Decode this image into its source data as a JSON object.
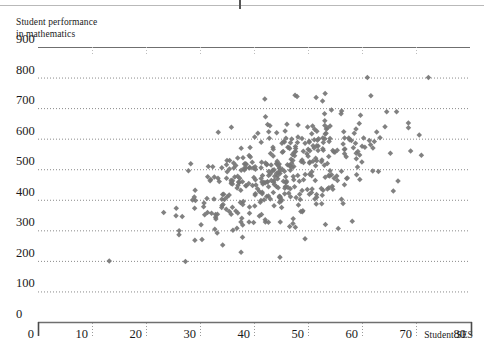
{
  "figure": {
    "y_axis_caption_line1": "Student performance",
    "y_axis_caption_line2": "in mathematics",
    "x_axis_caption": "Student SES"
  },
  "chart_data": {
    "type": "scatter",
    "title": "",
    "xlabel": "Student SES",
    "ylabel": "Student performance in mathematics",
    "xlim": [
      0,
      80
    ],
    "ylim": [
      0,
      900
    ],
    "xticks": [
      0,
      10,
      20,
      30,
      40,
      50,
      60,
      70,
      80
    ],
    "yticks": [
      0,
      100,
      200,
      300,
      400,
      500,
      600,
      700,
      800,
      900
    ],
    "grid": "horizontal dotted gridlines at every 100 on y; solid rules at y=900 and y=0; short dotted vertical ticks below baseline at each x tick",
    "legend": "none",
    "marker": "diamond",
    "marker_color": "#767676",
    "marker_size_px": 5.5,
    "n_points": 420,
    "correlation_note": "Positive association between student SES and mathematics performance; cloud centred near SES 45, score 480.",
    "cloud": {
      "x_mean": 45.0,
      "x_sd": 8.6,
      "x_min": 23.0,
      "x_max": 69.0,
      "y_intercept": 205,
      "y_slope": 6.2,
      "y_residual_sd": 82,
      "y_min": 240,
      "y_max": 760,
      "seed": 20240517
    },
    "outliers": [
      {
        "x": 13.2,
        "y": 200
      },
      {
        "x": 27.3,
        "y": 198
      },
      {
        "x": 37.6,
        "y": 228
      },
      {
        "x": 44.8,
        "y": 212
      },
      {
        "x": 34.2,
        "y": 252
      },
      {
        "x": 42.0,
        "y": 730
      },
      {
        "x": 47.6,
        "y": 742
      },
      {
        "x": 51.5,
        "y": 735
      },
      {
        "x": 61.0,
        "y": 800
      },
      {
        "x": 72.3,
        "y": 800
      },
      {
        "x": 66.4,
        "y": 688
      },
      {
        "x": 68.6,
        "y": 636
      },
      {
        "x": 70.6,
        "y": 612
      },
      {
        "x": 69.0,
        "y": 560
      },
      {
        "x": 71.0,
        "y": 546
      },
      {
        "x": 55.6,
        "y": 306
      },
      {
        "x": 58.2,
        "y": 330
      },
      {
        "x": 36.1,
        "y": 300
      },
      {
        "x": 30.2,
        "y": 318
      },
      {
        "x": 25.6,
        "y": 372
      }
    ]
  },
  "axes": {
    "y_tick_labels": [
      "900",
      "800",
      "700",
      "600",
      "500",
      "400",
      "300",
      "200",
      "100",
      "0"
    ],
    "x_tick_labels": [
      "0",
      "10",
      "20",
      "30",
      "40",
      "50",
      "60",
      "70",
      "80"
    ]
  }
}
